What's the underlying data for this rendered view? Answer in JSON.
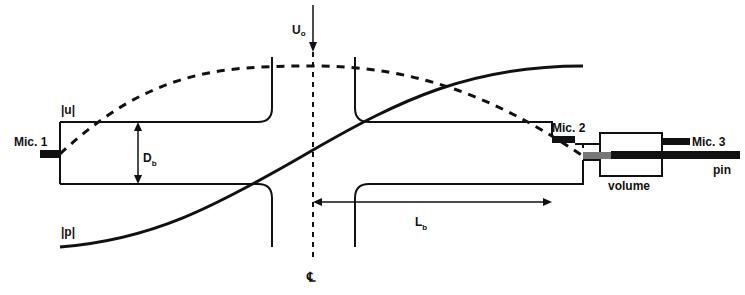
{
  "labels": {
    "mic1": "Mic. 1",
    "mic2": "Mic. 2",
    "mic3": "Mic. 3",
    "u_mag": "|u|",
    "p_mag": "|p|",
    "diameter": "D",
    "diameter_sub": "b",
    "length": "L",
    "length_sub": "b",
    "flow": "U",
    "flow_sub": "o",
    "volume": "volume",
    "pin": "pin",
    "centerline": "℄"
  },
  "colors": {
    "stroke": "#111111",
    "background": "#ffffff"
  }
}
